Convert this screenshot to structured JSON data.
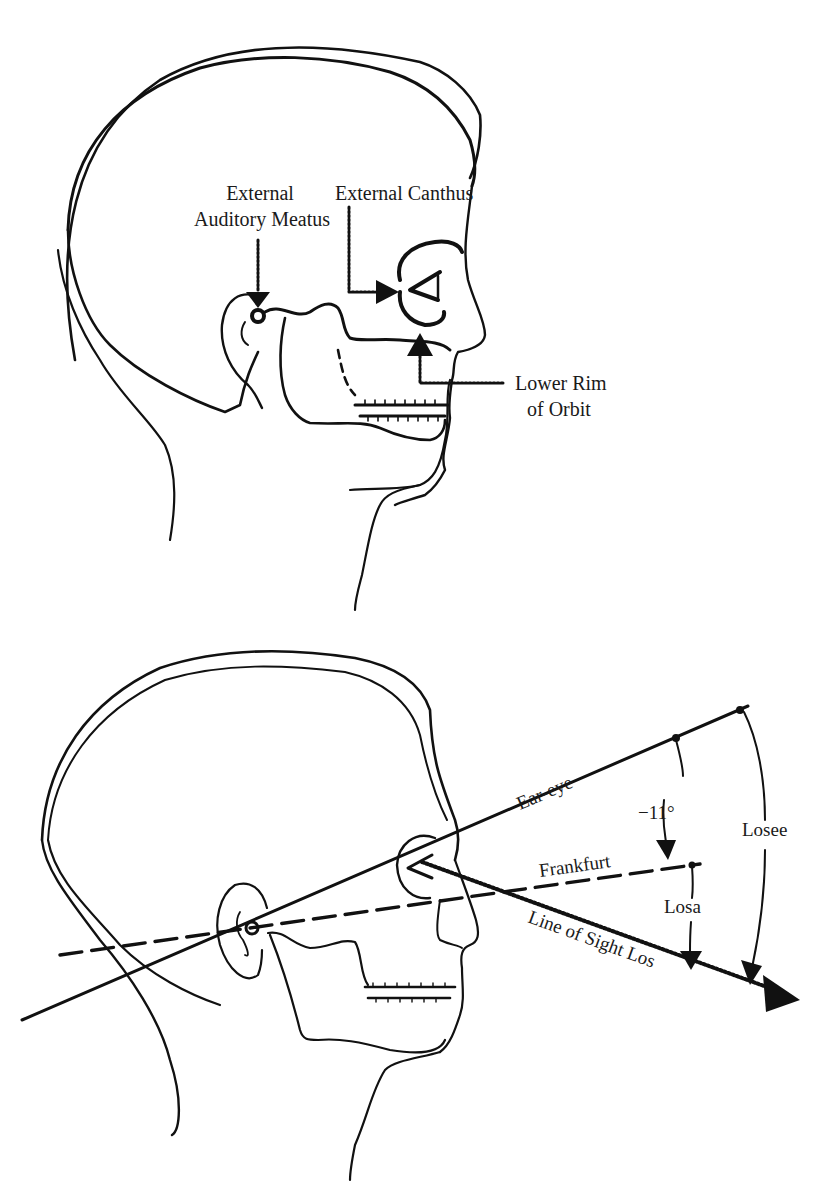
{
  "figure_top": {
    "title": "Head landmarks",
    "labels": {
      "auditory_meatus_line1": "External",
      "auditory_meatus_line2": "Auditory Meatus",
      "external_canthus": "External Canthus",
      "lower_rim_line1": "Lower Rim",
      "lower_rim_line2": "of Orbit"
    }
  },
  "figure_bottom": {
    "title": "Line of sight reference planes",
    "labels": {
      "ear_eye": "Ear-eye",
      "angle": "−11°",
      "frankfurt": "Frankfurt",
      "losa": "Losa",
      "losee": "Losee",
      "line_of_sight": "Line of Sight Los"
    }
  },
  "colors": {
    "ink": "#111111",
    "background": "#ffffff"
  }
}
